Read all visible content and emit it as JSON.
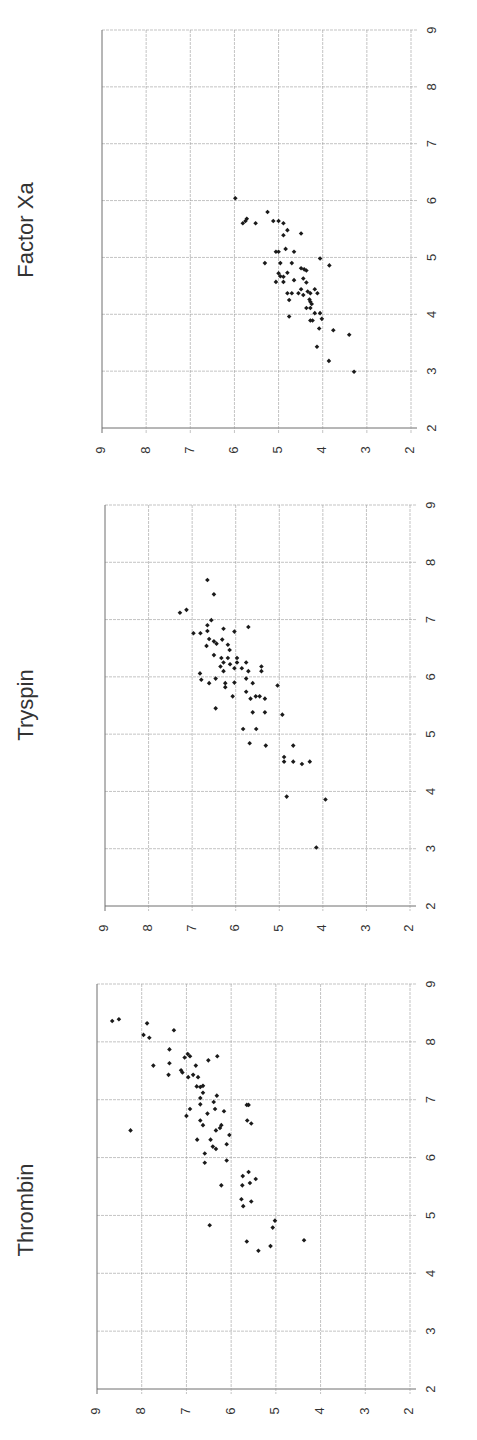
{
  "figure": {
    "orientation": "rotated 90 degrees counterclockwise (titles read bottom-to-top)",
    "background": "#ffffff",
    "grid_color": "#9a9a9a",
    "frame_color": "#6e6e6e",
    "marker_color": "#1a1a1a",
    "text_color": "#333333"
  },
  "chart_data": [
    {
      "type": "scatter",
      "title": "Factor Xa",
      "xlabel": "",
      "ylabel": "",
      "xlim": [
        2,
        9
      ],
      "ylim": [
        2,
        9
      ],
      "xticks": [
        2,
        3,
        4,
        5,
        6,
        7,
        8,
        9
      ],
      "yticks": [
        2,
        3,
        4,
        5,
        6,
        7,
        8,
        9
      ],
      "grid": true,
      "legend": null,
      "screen_frame": {
        "left": 102,
        "right": 411,
        "top": 30,
        "bottom": 428
      },
      "title_pos": {
        "x": 27,
        "y": 230
      },
      "points": [
        [
          6.04,
          5.98
        ],
        [
          5.68,
          5.72
        ],
        [
          5.6,
          5.81
        ],
        [
          5.64,
          5.75
        ],
        [
          5.6,
          5.52
        ],
        [
          5.8,
          5.25
        ],
        [
          5.64,
          5.12
        ],
        [
          5.64,
          5.0
        ],
        [
          5.6,
          4.89
        ],
        [
          5.48,
          4.8
        ],
        [
          5.39,
          4.89
        ],
        [
          5.42,
          4.49
        ],
        [
          5.1,
          4.65
        ],
        [
          5.15,
          4.84
        ],
        [
          5.1,
          5.06
        ],
        [
          5.1,
          5.0
        ],
        [
          4.9,
          5.31
        ],
        [
          4.9,
          4.96
        ],
        [
          4.9,
          4.7
        ],
        [
          4.98,
          4.06
        ],
        [
          4.86,
          3.85
        ],
        [
          4.72,
          5.0
        ],
        [
          4.66,
          4.89
        ],
        [
          4.73,
          4.8
        ],
        [
          4.67,
          4.96
        ],
        [
          4.57,
          5.06
        ],
        [
          4.57,
          4.89
        ],
        [
          4.6,
          4.65
        ],
        [
          4.81,
          4.49
        ],
        [
          4.79,
          4.42
        ],
        [
          4.77,
          4.37
        ],
        [
          4.63,
          4.44
        ],
        [
          4.56,
          4.37
        ],
        [
          4.44,
          4.49
        ],
        [
          4.37,
          4.8
        ],
        [
          4.37,
          4.7
        ],
        [
          4.37,
          4.55
        ],
        [
          4.34,
          4.44
        ],
        [
          4.4,
          4.34
        ],
        [
          4.37,
          4.28
        ],
        [
          4.44,
          4.18
        ],
        [
          4.37,
          4.12
        ],
        [
          4.25,
          4.76
        ],
        [
          4.22,
          4.28
        ],
        [
          4.11,
          4.37
        ],
        [
          4.11,
          4.28
        ],
        [
          4.02,
          4.18
        ],
        [
          4.02,
          4.06
        ],
        [
          3.96,
          4.76
        ],
        [
          3.89,
          4.28
        ],
        [
          3.89,
          4.23
        ],
        [
          3.92,
          4.02
        ],
        [
          3.75,
          4.08
        ],
        [
          3.72,
          3.76
        ],
        [
          3.64,
          3.4
        ],
        [
          3.43,
          4.13
        ],
        [
          3.18,
          3.86
        ],
        [
          2.99,
          3.29
        ],
        [
          4.26,
          4.3
        ],
        [
          4.18,
          4.25
        ]
      ]
    },
    {
      "type": "scatter",
      "title": "Tryspin",
      "xlabel": "",
      "ylabel": "",
      "xlim": [
        2,
        9
      ],
      "ylim": [
        2,
        9
      ],
      "xticks": [
        2,
        3,
        4,
        5,
        6,
        7,
        8,
        9
      ],
      "yticks": [
        2,
        3,
        4,
        5,
        6,
        7,
        8,
        9
      ],
      "grid": true,
      "legend": null,
      "screen_frame": {
        "left": 105,
        "right": 410,
        "top": 505,
        "bottom": 906
      },
      "title_pos": {
        "x": 27,
        "y": 705
      },
      "points": [
        [
          7.12,
          7.28
        ],
        [
          7.17,
          7.13
        ],
        [
          7.69,
          6.65
        ],
        [
          7.44,
          6.5
        ],
        [
          6.99,
          6.56
        ],
        [
          6.76,
          6.97
        ],
        [
          6.76,
          6.81
        ],
        [
          6.9,
          6.65
        ],
        [
          6.8,
          6.65
        ],
        [
          6.66,
          6.61
        ],
        [
          6.62,
          6.5
        ],
        [
          6.54,
          6.67
        ],
        [
          6.58,
          6.44
        ],
        [
          6.84,
          6.28
        ],
        [
          6.65,
          6.31
        ],
        [
          6.79,
          6.03
        ],
        [
          6.87,
          5.71
        ],
        [
          6.56,
          6.18
        ],
        [
          6.47,
          6.14
        ],
        [
          6.38,
          6.5
        ],
        [
          6.33,
          6.33
        ],
        [
          6.25,
          6.28
        ],
        [
          6.18,
          6.35
        ],
        [
          6.1,
          6.28
        ],
        [
          6.22,
          6.13
        ],
        [
          6.33,
          6.18
        ],
        [
          6.33,
          5.97
        ],
        [
          6.25,
          5.97
        ],
        [
          6.15,
          6.03
        ],
        [
          6.15,
          5.86
        ],
        [
          6.25,
          5.76
        ],
        [
          6.1,
          5.71
        ],
        [
          6.18,
          5.41
        ],
        [
          6.1,
          5.41
        ],
        [
          6.06,
          6.82
        ],
        [
          5.95,
          6.79
        ],
        [
          5.89,
          6.61
        ],
        [
          5.97,
          6.46
        ],
        [
          5.89,
          6.24
        ],
        [
          5.82,
          6.24
        ],
        [
          5.9,
          6.03
        ],
        [
          5.97,
          5.76
        ],
        [
          5.89,
          5.61
        ],
        [
          5.85,
          5.04
        ],
        [
          5.74,
          5.76
        ],
        [
          5.66,
          6.07
        ],
        [
          5.62,
          5.66
        ],
        [
          5.66,
          5.54
        ],
        [
          5.66,
          5.45
        ],
        [
          5.62,
          5.33
        ],
        [
          5.45,
          6.46
        ],
        [
          5.38,
          5.61
        ],
        [
          5.38,
          5.33
        ],
        [
          5.34,
          4.93
        ],
        [
          5.09,
          5.83
        ],
        [
          5.09,
          5.53
        ],
        [
          4.84,
          5.68
        ],
        [
          4.8,
          5.31
        ],
        [
          4.8,
          4.68
        ],
        [
          4.6,
          4.89
        ],
        [
          4.52,
          4.89
        ],
        [
          4.52,
          4.68
        ],
        [
          4.48,
          4.48
        ],
        [
          4.52,
          4.3
        ],
        [
          3.91,
          4.83
        ],
        [
          3.86,
          3.94
        ],
        [
          3.02,
          4.15
        ]
      ]
    },
    {
      "type": "scatter",
      "title": "Thrombin",
      "xlabel": "",
      "ylabel": "",
      "xlim": [
        2,
        9
      ],
      "ylim": [
        2,
        9
      ],
      "xticks": [
        2,
        3,
        4,
        5,
        6,
        7,
        8,
        9
      ],
      "yticks": [
        2,
        3,
        4,
        5,
        6,
        7,
        8,
        9
      ],
      "grid": true,
      "legend": null,
      "screen_frame": {
        "left": 97,
        "right": 410,
        "top": 984,
        "bottom": 1389
      },
      "title_pos": {
        "x": 27,
        "y": 1210
      },
      "points": [
        [
          8.36,
          8.66
        ],
        [
          8.39,
          8.51
        ],
        [
          8.32,
          7.88
        ],
        [
          8.2,
          7.28
        ],
        [
          8.12,
          7.96
        ],
        [
          8.07,
          7.83
        ],
        [
          7.87,
          7.38
        ],
        [
          7.79,
          6.97
        ],
        [
          7.73,
          7.04
        ],
        [
          7.75,
          6.92
        ],
        [
          7.75,
          6.31
        ],
        [
          7.68,
          6.51
        ],
        [
          7.59,
          7.74
        ],
        [
          7.63,
          7.38
        ],
        [
          7.59,
          6.79
        ],
        [
          7.51,
          7.12
        ],
        [
          7.47,
          7.09
        ],
        [
          7.43,
          7.4
        ],
        [
          7.39,
          6.96
        ],
        [
          7.43,
          6.85
        ],
        [
          7.39,
          6.74
        ],
        [
          7.23,
          6.77
        ],
        [
          7.22,
          6.69
        ],
        [
          7.24,
          6.63
        ],
        [
          7.12,
          6.63
        ],
        [
          7.07,
          6.32
        ],
        [
          7.03,
          6.69
        ],
        [
          6.96,
          6.39
        ],
        [
          6.92,
          6.69
        ],
        [
          6.91,
          5.65
        ],
        [
          6.91,
          5.61
        ],
        [
          6.84,
          6.92
        ],
        [
          6.84,
          6.36
        ],
        [
          6.8,
          6.16
        ],
        [
          6.72,
          7.0
        ],
        [
          6.76,
          6.53
        ],
        [
          6.64,
          6.69
        ],
        [
          6.64,
          5.64
        ],
        [
          6.56,
          6.63
        ],
        [
          6.56,
          6.22
        ],
        [
          6.59,
          5.55
        ],
        [
          6.47,
          8.25
        ],
        [
          6.47,
          6.34
        ],
        [
          6.51,
          6.25
        ],
        [
          6.39,
          6.04
        ],
        [
          6.31,
          6.76
        ],
        [
          6.31,
          6.46
        ],
        [
          6.23,
          6.1
        ],
        [
          6.19,
          6.41
        ],
        [
          6.15,
          6.34
        ],
        [
          6.07,
          6.59
        ],
        [
          5.91,
          6.59
        ],
        [
          5.95,
          6.1
        ],
        [
          5.75,
          5.61
        ],
        [
          5.68,
          5.74
        ],
        [
          5.63,
          5.45
        ],
        [
          5.56,
          5.58
        ],
        [
          5.52,
          5.75
        ],
        [
          5.52,
          6.22
        ],
        [
          5.28,
          5.77
        ],
        [
          5.24,
          5.55
        ],
        [
          5.16,
          5.73
        ],
        [
          4.91,
          5.02
        ],
        [
          4.79,
          5.07
        ],
        [
          4.83,
          6.48
        ],
        [
          4.55,
          5.65
        ],
        [
          4.47,
          5.12
        ],
        [
          4.39,
          5.39
        ],
        [
          4.57,
          4.37
        ]
      ]
    }
  ]
}
